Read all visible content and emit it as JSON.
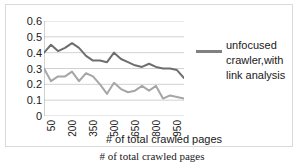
{
  "caption": "# of total crawled pages",
  "legend": {
    "label": "unfocused crawler,with link analysis",
    "swatch_color": "#808080"
  },
  "chart_data": {
    "type": "line",
    "title": "",
    "xlabel": "# of total crawled pages",
    "ylabel": "",
    "ylim": [
      0,
      0.6
    ],
    "y_ticks": [
      "0",
      "0.1",
      "0.2",
      "0.3",
      "0.4",
      "0.5",
      "0.6"
    ],
    "y_tick_values": [
      0,
      0.1,
      0.2,
      0.3,
      0.4,
      0.5,
      0.6
    ],
    "x_tick_labels": [
      "50",
      "200",
      "350",
      "500",
      "650",
      "800",
      "950"
    ],
    "x_tick_positions": [
      1,
      4,
      7,
      10,
      13,
      16,
      19
    ],
    "x": [
      50,
      100,
      150,
      200,
      250,
      300,
      350,
      400,
      450,
      500,
      550,
      600,
      650,
      700,
      750,
      800,
      850,
      900,
      950,
      1000,
      1050
    ],
    "grid": true,
    "legend_position": "right",
    "series": [
      {
        "name": "unfocused crawler,with link analysis",
        "color": "#6e6e6e",
        "values": [
          0.4,
          0.45,
          0.41,
          0.43,
          0.46,
          0.43,
          0.38,
          0.35,
          0.35,
          0.34,
          0.4,
          0.36,
          0.34,
          0.32,
          0.31,
          0.33,
          0.31,
          0.3,
          0.3,
          0.29,
          0.24
        ]
      },
      {
        "name": "series-2",
        "color": "#a6a6a6",
        "values": [
          0.3,
          0.22,
          0.25,
          0.25,
          0.28,
          0.22,
          0.27,
          0.25,
          0.2,
          0.14,
          0.21,
          0.17,
          0.15,
          0.16,
          0.19,
          0.16,
          0.19,
          0.11,
          0.13,
          0.12,
          0.11
        ]
      }
    ]
  }
}
